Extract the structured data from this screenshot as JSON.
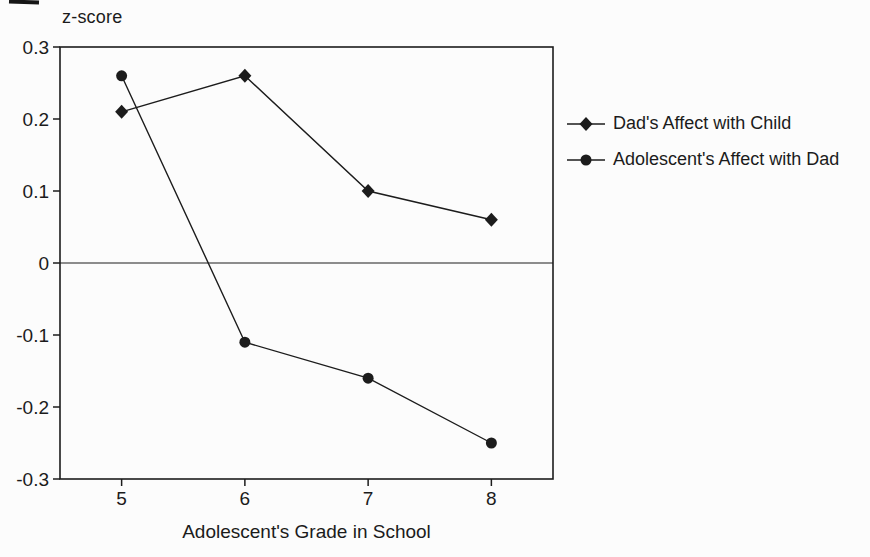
{
  "chart_data": {
    "type": "line",
    "title": "",
    "ylabel": "z-score",
    "xlabel": "Adolescent's Grade in School",
    "categories": [
      "5",
      "6",
      "7",
      "8"
    ],
    "ylim": [
      -0.3,
      0.3
    ],
    "ytick_values": [
      0.3,
      0.2,
      0.1,
      0,
      -0.1,
      -0.2,
      -0.3
    ],
    "ytick_labels": [
      "0.3",
      "0.2",
      "0.1",
      "0",
      "-0.1",
      "-0.2",
      "-0.3"
    ],
    "zero_line": true,
    "grid": false,
    "legend_position": "right",
    "axis_color": "#1c1c1c",
    "text_color": "#1b1b1b",
    "series": [
      {
        "name": "Dad's Affect with Child",
        "marker": "diamond",
        "color": "#1c1c1c",
        "values": [
          0.21,
          0.26,
          0.1,
          0.06
        ]
      },
      {
        "name": "Adolescent's Affect with Dad",
        "marker": "circle",
        "color": "#1c1c1c",
        "values": [
          0.26,
          -0.11,
          -0.16,
          -0.25
        ]
      }
    ]
  }
}
